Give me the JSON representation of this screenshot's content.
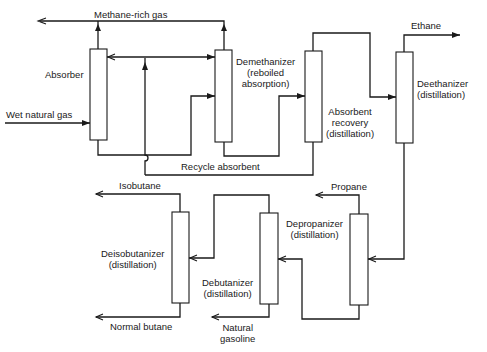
{
  "diagram": {
    "type": "process-flow",
    "units": [
      {
        "id": "absorber",
        "name": "Absorber",
        "lines": [
          "Absorber"
        ]
      },
      {
        "id": "demethanizer",
        "name": "Demethanizer (reboiled absorption)",
        "lines": [
          "Demethanizer",
          "(reboiled",
          "absorption)"
        ]
      },
      {
        "id": "absorbent_recovery",
        "name": "Absorbent recovery (distillation)",
        "lines": [
          "Absorbent",
          "recovery",
          "(distillation)"
        ]
      },
      {
        "id": "deethanizer",
        "name": "Deethanizer (distillation)",
        "lines": [
          "Deethanizer",
          "(distillation)"
        ]
      },
      {
        "id": "depropanizer",
        "name": "Depropanizer (distillation)",
        "lines": [
          "Depropanizer",
          "(distillation)"
        ]
      },
      {
        "id": "debutanizer",
        "name": "Debutanizer (distillation)",
        "lines": [
          "Debutanizer",
          "(distillation)"
        ]
      },
      {
        "id": "deisobutanizer",
        "name": "Deisobutanizer (distillation)",
        "lines": [
          "Deisobutanizer",
          "(distillation)"
        ]
      }
    ],
    "streams": [
      {
        "id": "wet_gas",
        "label": "Wet natural gas",
        "from": "feed",
        "to": "absorber"
      },
      {
        "id": "methane",
        "label": "Methane-rich gas",
        "from": [
          "absorber",
          "demethanizer"
        ],
        "to": "product"
      },
      {
        "id": "recycle",
        "label": "Recycle absorbent",
        "from": "absorbent_recovery",
        "to": [
          "absorber",
          "demethanizer"
        ]
      },
      {
        "id": "ethane",
        "label": "Ethane",
        "from": "deethanizer",
        "to": "product"
      },
      {
        "id": "propane",
        "label": "Propane",
        "from": "depropanizer",
        "to": "product"
      },
      {
        "id": "isobutane",
        "label": "Isobutane",
        "from": "deisobutanizer",
        "to": "product"
      },
      {
        "id": "normal_butane",
        "label": "Normal butane",
        "from": "deisobutanizer",
        "to": "product"
      },
      {
        "id": "natural_gasoline",
        "label_lines": [
          "Natural",
          "gasoline"
        ],
        "label": "Natural gasoline",
        "from": "debutanizer",
        "to": "product"
      }
    ],
    "colors": {
      "line": "#1a1a1a",
      "background": "#ffffff"
    }
  }
}
